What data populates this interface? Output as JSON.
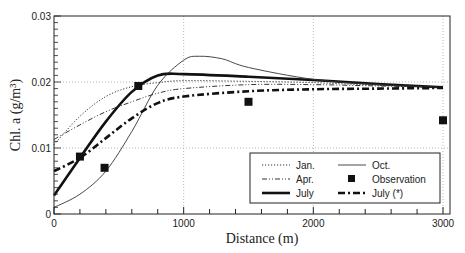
{
  "chart_data": {
    "type": "line",
    "title": "",
    "xlabel": "Distance (m)",
    "ylabel": "Chl. a (g/m³)",
    "xlim": [
      0,
      3000
    ],
    "ylim": [
      0,
      0.03
    ],
    "x_ticks": [
      0,
      1000,
      2000,
      3000
    ],
    "x_tick_labels": [
      "0",
      "1000",
      "2000",
      "3000"
    ],
    "y_ticks": [
      0,
      0.01,
      0.02,
      0.03
    ],
    "y_tick_labels": [
      "0",
      "0.01",
      "0.02",
      "0.03"
    ],
    "grid": "dotted at major ticks",
    "legend_position": "bottom-right",
    "series": [
      {
        "name": "Jan.",
        "style": "dotted",
        "x": [
          0,
          200,
          400,
          600,
          800,
          1000,
          1500,
          2000,
          2500,
          3000
        ],
        "y": [
          0.0105,
          0.0148,
          0.0178,
          0.0193,
          0.0199,
          0.0202,
          0.0201,
          0.0199,
          0.0195,
          0.0192
        ]
      },
      {
        "name": "Apr.",
        "style": "dash-dot-dot",
        "x": [
          0,
          200,
          400,
          600,
          800,
          1000,
          1500,
          2000,
          2500,
          3000
        ],
        "y": [
          0.0113,
          0.0135,
          0.0155,
          0.017,
          0.0183,
          0.019,
          0.0196,
          0.0196,
          0.0194,
          0.0192
        ]
      },
      {
        "name": "July",
        "style": "thick-solid",
        "x": [
          0,
          200,
          400,
          600,
          800,
          1000,
          1500,
          2000,
          2500,
          3000
        ],
        "y": [
          0.0028,
          0.0085,
          0.014,
          0.0185,
          0.021,
          0.0212,
          0.0208,
          0.0203,
          0.0197,
          0.0192
        ]
      },
      {
        "name": "Oct.",
        "style": "thin-solid",
        "x": [
          0,
          200,
          400,
          600,
          800,
          1000,
          1120,
          1300,
          1500,
          2000,
          2500,
          3000
        ],
        "y": [
          0.001,
          0.003,
          0.0065,
          0.0125,
          0.0195,
          0.0233,
          0.0239,
          0.0235,
          0.0222,
          0.0204,
          0.0196,
          0.0192
        ]
      },
      {
        "name": "July (*)",
        "style": "thick-dash-dot",
        "x": [
          0,
          200,
          400,
          600,
          800,
          1000,
          1500,
          2000,
          2500,
          3000
        ],
        "y": [
          0.0065,
          0.0085,
          0.0115,
          0.0145,
          0.0168,
          0.0178,
          0.0186,
          0.0189,
          0.019,
          0.0191
        ]
      }
    ],
    "observations": {
      "name": "Observation",
      "marker": "filled-square",
      "x": [
        200,
        390,
        650,
        1500,
        3000
      ],
      "y": [
        0.0087,
        0.007,
        0.0194,
        0.017,
        0.0142
      ]
    },
    "legend": [
      {
        "label": "Jan.",
        "style": "dotted"
      },
      {
        "label": "Oct.",
        "style": "thin-solid"
      },
      {
        "label": "Apr.",
        "style": "dash-dot-dot"
      },
      {
        "label": "Observation",
        "style": "filled-square"
      },
      {
        "label": "July",
        "style": "thick-solid"
      },
      {
        "label": "July (*)",
        "style": "thick-dash-dot"
      }
    ]
  }
}
